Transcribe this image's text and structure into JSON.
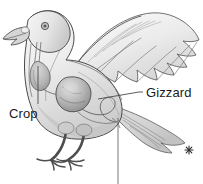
{
  "figure": {
    "background_color": "#ffffff",
    "ink_color": "#3a3a3a",
    "label_text_color": "#1a1a1a",
    "body_fill_light": "#f2f2f2",
    "body_fill_mid": "#d9d9d9",
    "body_fill_dark": "#b0b0b0",
    "organ_fill": "#bdbdbd",
    "organ_shadow": "#8f8f8f",
    "leader_line_color": "#4a4a4a",
    "width": 203,
    "height": 184
  },
  "labels": {
    "crop": "Crop",
    "gizzard": "Gizzard"
  },
  "marks": {
    "asterisk": "✳",
    "asterisk_x": 189,
    "asterisk_y": 150
  },
  "leaders": {
    "crop": {
      "from_x": 38,
      "from_y": 66,
      "to_x": 38,
      "to_y": 104,
      "organ": "crop"
    },
    "gizzard": {
      "from_x": 98,
      "from_y": 99,
      "mid_x": 139,
      "mid_y": 92,
      "to_x": 143,
      "to_y": 92,
      "organ": "gizzard"
    },
    "unlabeled_lower": {
      "from_x": 118,
      "from_y": 118,
      "to_x": 118,
      "to_y": 184,
      "organ": "intestine"
    }
  },
  "parts": {
    "head": "head",
    "beak": "beak",
    "eye": "eye",
    "neck": "neck",
    "esophagus": "esophagus",
    "crop_organ": "crop",
    "gizzard_organ": "gizzard",
    "intestine": "intestine",
    "wing": "outstretched-wing",
    "tail": "tail-feathers",
    "legs": "legs",
    "feet": "feet"
  }
}
